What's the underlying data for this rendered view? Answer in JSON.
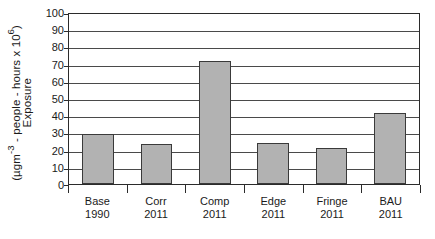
{
  "chart_data": {
    "type": "bar",
    "title": "",
    "xlabel": "",
    "ylabel_line1": "Exposure",
    "ylabel_line2": "(µgm-3 - people - hours x 106)",
    "ylabel_line2_parts": {
      "prefix": "(µgm",
      "sup1": "-3",
      "middle": " - people - hours x 10",
      "sup2": "6",
      "suffix": ")"
    },
    "categories": [
      "Base 1990",
      "Corr 2011",
      "Comp 2011",
      "Edge 2011",
      "Fringe 2011",
      "BAU 2011"
    ],
    "category_lines": [
      {
        "line1": "Base",
        "line2": "1990"
      },
      {
        "line1": "Corr",
        "line2": "2011"
      },
      {
        "line1": "Comp",
        "line2": "2011"
      },
      {
        "line1": "Edge",
        "line2": "2011"
      },
      {
        "line1": "Fringe",
        "line2": "2011"
      },
      {
        "line1": "BAU",
        "line2": "2011"
      }
    ],
    "values": [
      29,
      23.5,
      71.5,
      24,
      21,
      41.5
    ],
    "ylim": [
      0,
      100
    ],
    "ytick_step": 10,
    "yticks": [
      100,
      90,
      80,
      70,
      60,
      50,
      40,
      30,
      20,
      10,
      0
    ],
    "ytick_labels": [
      "100",
      "90",
      "80",
      "70",
      "60",
      "50",
      "40",
      "30",
      "20",
      "10",
      "0"
    ],
    "grid": true,
    "legend": "none",
    "bar_color": "#b2b2b2",
    "bar_edge_color": "#3a3a3a",
    "axis_color": "#2b2b2b",
    "grid_color": "#4a4a4a",
    "background_color": "#ffffff"
  }
}
